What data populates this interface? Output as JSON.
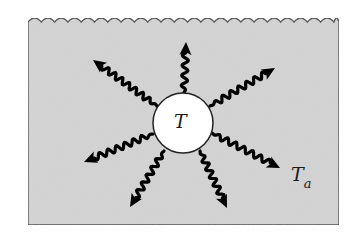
{
  "diagram": {
    "labels": {
      "body_temperature": "T",
      "ambient_temperature_main": "T",
      "ambient_temperature_sub": "a"
    },
    "colors": {
      "fluid": "#d4d4d4",
      "body": "#ffffff",
      "arrows": "#000000",
      "outline": "#444444"
    },
    "body": {
      "cx": 183,
      "cy": 123,
      "r": 30
    },
    "container": {
      "left": 28,
      "right": 339,
      "top": 22,
      "bottom": 225
    },
    "arrows": [
      {
        "name": "up",
        "x1": 184,
        "y1": 93,
        "x2": 186,
        "y2": 42
      },
      {
        "name": "upper-right",
        "x1": 210,
        "y1": 106,
        "x2": 275,
        "y2": 68
      },
      {
        "name": "upper-left",
        "x1": 157,
        "y1": 106,
        "x2": 93,
        "y2": 60
      },
      {
        "name": "left",
        "x1": 153,
        "y1": 134,
        "x2": 84,
        "y2": 162
      },
      {
        "name": "lower-left",
        "x1": 164,
        "y1": 151,
        "x2": 130,
        "y2": 207
      },
      {
        "name": "lower-center",
        "x1": 200,
        "y1": 151,
        "x2": 227,
        "y2": 208
      },
      {
        "name": "lower-right",
        "x1": 212,
        "y1": 133,
        "x2": 280,
        "y2": 168
      }
    ]
  }
}
